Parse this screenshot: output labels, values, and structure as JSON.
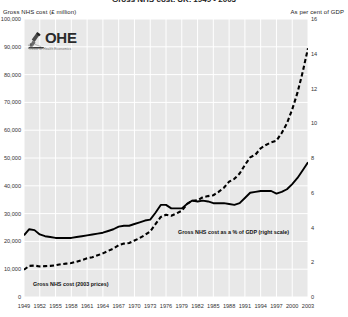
{
  "title": "Gross NHS cost, UK, 1949 - 2003",
  "axis_headers": {
    "left": "Gross NHS cost (£ million)",
    "right": "As per cent of GDP"
  },
  "logo": {
    "mark": "ohe-microscope-icon",
    "text": "OHE",
    "subtitle": "Office of Health Economics"
  },
  "series_labels": {
    "gdp": "Gross NHS cost as a % of GDP (right scale)",
    "cost": "Gross NHS cost (2003 prices)"
  },
  "chart_data": {
    "type": "line",
    "title": "Gross NHS cost, UK, 1949 - 2003",
    "xlabel": "",
    "ylabel": "Gross NHS cost (£ million)",
    "y2label": "As per cent of GDP",
    "grid": true,
    "legend": "inline-annotations",
    "xlim": [
      1949,
      2003
    ],
    "ylim": [
      0,
      100000
    ],
    "y2lim": [
      0,
      16
    ],
    "yticks": [
      0,
      10000,
      20000,
      30000,
      40000,
      50000,
      60000,
      70000,
      80000,
      90000,
      100000
    ],
    "ytick_labels": [
      "0",
      "10,000",
      "20,000",
      "30,000",
      "40,000",
      "50,000",
      "60,000",
      "70,000",
      "80,000",
      "90,000",
      "100,000"
    ],
    "y2ticks": [
      0,
      2,
      4,
      6,
      8,
      10,
      12,
      14,
      16
    ],
    "y2tick_labels": [
      "0",
      "2",
      "4",
      "6",
      "8",
      "10",
      "12",
      "14",
      "16"
    ],
    "xticks": [
      1949,
      1952,
      1955,
      1958,
      1961,
      1964,
      1967,
      1970,
      1973,
      1976,
      1979,
      1982,
      1985,
      1988,
      1991,
      1994,
      1997,
      2000,
      2003
    ],
    "xtick_labels": [
      "1949",
      "1952",
      "1955",
      "1958",
      "1961",
      "1964",
      "1967",
      "1970",
      "1973",
      "1976",
      "1979",
      "1982",
      "1985",
      "1988",
      "1991",
      "1994",
      "1997",
      "2000",
      "2003"
    ],
    "x": [
      1949,
      1950,
      1951,
      1952,
      1953,
      1954,
      1955,
      1956,
      1957,
      1958,
      1959,
      1960,
      1961,
      1962,
      1963,
      1964,
      1965,
      1966,
      1967,
      1968,
      1969,
      1970,
      1971,
      1972,
      1973,
      1974,
      1975,
      1976,
      1977,
      1978,
      1979,
      1980,
      1981,
      1982,
      1983,
      1984,
      1985,
      1986,
      1987,
      1988,
      1989,
      1990,
      1991,
      1992,
      1993,
      1994,
      1995,
      1996,
      1997,
      1998,
      1999,
      2000,
      2001,
      2002,
      2003
    ],
    "series": [
      {
        "name": "Gross NHS cost (2003 prices)",
        "axis": "left",
        "style": "dashed",
        "color": "#000000",
        "unit": "£ million",
        "values": [
          9800,
          11200,
          11300,
          11000,
          11100,
          11200,
          11400,
          11800,
          12000,
          12200,
          12700,
          13300,
          13900,
          14300,
          15000,
          15700,
          16600,
          17400,
          18600,
          19200,
          19400,
          20300,
          21200,
          22300,
          23600,
          26200,
          28800,
          29600,
          29200,
          30100,
          31000,
          33500,
          34600,
          34800,
          35900,
          36300,
          36600,
          37800,
          39300,
          41500,
          42500,
          44400,
          47500,
          50200,
          51200,
          53500,
          54700,
          55600,
          56200,
          59000,
          62500,
          67500,
          73500,
          81000,
          89500
        ]
      },
      {
        "name": "Gross NHS cost as a % of GDP (right scale)",
        "axis": "right",
        "style": "solid",
        "color": "#000000",
        "unit": "%",
        "values": [
          3.55,
          3.9,
          3.85,
          3.6,
          3.5,
          3.45,
          3.4,
          3.4,
          3.4,
          3.4,
          3.45,
          3.5,
          3.55,
          3.6,
          3.65,
          3.7,
          3.8,
          3.9,
          4.05,
          4.1,
          4.1,
          4.2,
          4.3,
          4.4,
          4.45,
          4.85,
          5.3,
          5.3,
          5.1,
          5.1,
          5.1,
          5.35,
          5.55,
          5.5,
          5.55,
          5.5,
          5.4,
          5.4,
          5.4,
          5.35,
          5.3,
          5.4,
          5.7,
          6.0,
          6.05,
          6.1,
          6.1,
          6.1,
          5.95,
          6.05,
          6.2,
          6.5,
          6.85,
          7.3,
          7.75
        ]
      }
    ]
  }
}
